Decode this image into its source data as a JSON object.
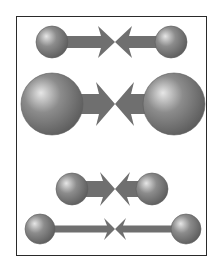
{
  "diagram": {
    "type": "illustration",
    "colors": {
      "frame": "#2a2a2a",
      "sphere_base": "#8c8c8c",
      "sphere_highlight": "#e6e6e6",
      "sphere_shadow": "#5e5e5e",
      "arrow": "#6f6f6f",
      "background": "#ffffff"
    },
    "meeting_point_x": 115,
    "rows": [
      {
        "id": "row-1",
        "y": 42,
        "left_sphere": {
          "cx": 52,
          "r": 16
        },
        "right_sphere": {
          "cx": 171,
          "r": 16
        },
        "arrow_thickness": 12,
        "arrowhead_half_height": 16,
        "arrowhead_length": 14
      },
      {
        "id": "row-2",
        "y": 104,
        "left_sphere": {
          "cx": 52,
          "r": 31
        },
        "right_sphere": {
          "cx": 174,
          "r": 31
        },
        "arrow_thickness": 20,
        "arrowhead_half_height": 22,
        "arrowhead_length": 16
      },
      {
        "id": "row-3",
        "y": 189,
        "left_sphere": {
          "cx": 72,
          "r": 16
        },
        "right_sphere": {
          "cx": 152,
          "r": 16
        },
        "arrow_thickness": 16,
        "arrowhead_half_height": 17,
        "arrowhead_length": 12
      },
      {
        "id": "row-4",
        "y": 229,
        "left_sphere": {
          "cx": 40,
          "r": 15
        },
        "right_sphere": {
          "cx": 186,
          "r": 15
        },
        "arrow_thickness": 7,
        "arrowhead_half_height": 11,
        "arrowhead_length": 8
      }
    ]
  }
}
